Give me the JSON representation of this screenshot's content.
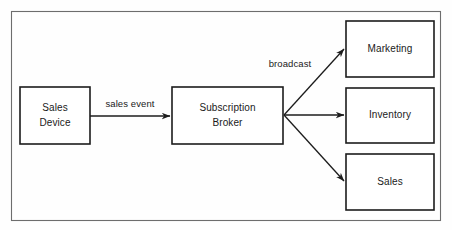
{
  "diagram": {
    "colors": {
      "background": "#fefefe",
      "node_fill": "#ffffff",
      "node_stroke": "#1c1c1c",
      "frame_stroke": "#6d6d6d",
      "edge_stroke": "#1c1c1c",
      "text": "#1a1a1a"
    },
    "frame": {
      "x": 11,
      "y": 11,
      "width": 430,
      "height": 210
    },
    "nodes": [
      {
        "id": "sales-device",
        "label_line1": "Sales",
        "label_line2": "Device",
        "x": 20,
        "y": 87,
        "width": 70,
        "height": 57
      },
      {
        "id": "subscription-broker",
        "label_line1": "Subscription",
        "label_line2": "Broker",
        "x": 172,
        "y": 87,
        "width": 111,
        "height": 57
      },
      {
        "id": "marketing",
        "label_line1": "Marketing",
        "label_line2": "",
        "x": 346,
        "y": 21,
        "width": 88,
        "height": 56
      },
      {
        "id": "inventory",
        "label_line1": "Inventory",
        "label_line2": "",
        "x": 346,
        "y": 88,
        "width": 88,
        "height": 55
      },
      {
        "id": "sales",
        "label_line1": "Sales",
        "label_line2": "",
        "x": 346,
        "y": 154,
        "width": 88,
        "height": 56
      }
    ],
    "edges": [
      {
        "id": "sales-event",
        "label": "sales event",
        "from": "sales-device",
        "to": "subscription-broker",
        "x1": 90,
        "y1": 116,
        "x2": 170,
        "y2": 116,
        "label_x": 130,
        "label_y": 104
      },
      {
        "id": "broadcast-marketing",
        "label": "broadcast",
        "from": "subscription-broker",
        "to": "marketing",
        "x1": 284,
        "y1": 115,
        "x2": 344,
        "y2": 49,
        "label_x": 290,
        "label_y": 64
      },
      {
        "id": "broadcast-inventory",
        "label": "",
        "from": "subscription-broker",
        "to": "inventory",
        "x1": 284,
        "y1": 115,
        "x2": 344,
        "y2": 115,
        "label_x": 0,
        "label_y": 0
      },
      {
        "id": "broadcast-sales",
        "label": "",
        "from": "subscription-broker",
        "to": "sales",
        "x1": 284,
        "y1": 115,
        "x2": 344,
        "y2": 181,
        "label_x": 0,
        "label_y": 0
      }
    ]
  }
}
